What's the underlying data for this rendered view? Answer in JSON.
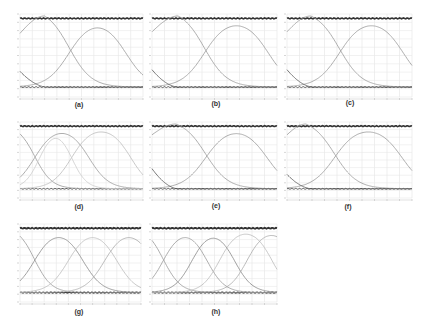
{
  "figure": {
    "panels": [
      {
        "id": "a",
        "label": "(a)",
        "x": 20,
        "y": 14,
        "w": 123,
        "h": 83,
        "label_x": 79,
        "label_y": 101
      },
      {
        "id": "b",
        "label": "(b)",
        "x": 152,
        "y": 14,
        "w": 125,
        "h": 83,
        "label_x": 216,
        "label_y": 100
      },
      {
        "id": "c",
        "label": "(c)",
        "x": 287,
        "y": 14,
        "w": 125,
        "h": 83,
        "label_x": 350,
        "label_y": 99
      },
      {
        "id": "d",
        "label": "(d)",
        "x": 20,
        "y": 122,
        "w": 123,
        "h": 76,
        "label_x": 79,
        "label_y": 203
      },
      {
        "id": "e",
        "label": "(e)",
        "x": 152,
        "y": 122,
        "w": 125,
        "h": 76,
        "label_x": 216,
        "label_y": 202
      },
      {
        "id": "f",
        "label": "(f)",
        "x": 287,
        "y": 122,
        "w": 125,
        "h": 76,
        "label_x": 348,
        "label_y": 203
      },
      {
        "id": "g",
        "label": "(g)",
        "x": 20,
        "y": 224,
        "w": 121,
        "h": 78,
        "label_x": 79,
        "label_y": 308
      },
      {
        "id": "h",
        "label": "(h)",
        "x": 152,
        "y": 224,
        "w": 125,
        "h": 78,
        "label_x": 216,
        "label_y": 308
      }
    ]
  },
  "chart_data": [
    {
      "panel": "(a)",
      "type": "line",
      "title": "",
      "xlabel": "",
      "ylabel": "",
      "grid": true,
      "ylim": [
        0,
        1
      ],
      "xlim": [
        0,
        10
      ],
      "series": [
        {
          "name": "upper band",
          "kind": "flat",
          "level": 0.97,
          "color": "#333333",
          "width": 1.6
        },
        {
          "name": "lower band",
          "kind": "flat",
          "level": 0.1,
          "color": "#555555",
          "width": 1.0
        },
        {
          "name": "curve 1 (falling)",
          "kind": "fall",
          "center": 4.0,
          "width": 0.9,
          "start": 0.78,
          "peak_at": 2.0,
          "color": "#999999"
        },
        {
          "name": "curve 2 (rising)",
          "kind": "bump",
          "rise": 4.0,
          "fall": 8.6,
          "width": 0.9,
          "color": "#999999"
        },
        {
          "name": "decay",
          "kind": "decay",
          "start": 0.3,
          "end": 2.2,
          "color": "#555555"
        }
      ]
    },
    {
      "panel": "(b)",
      "type": "line",
      "title": "",
      "xlabel": "",
      "ylabel": "",
      "grid": true,
      "ylim": [
        0,
        1
      ],
      "xlim": [
        0,
        10
      ],
      "series": [
        {
          "name": "upper band",
          "kind": "flat",
          "level": 0.97,
          "color": "#333333",
          "width": 1.6
        },
        {
          "name": "lower band",
          "kind": "flat",
          "level": 0.1,
          "color": "#555555",
          "width": 1.0
        },
        {
          "name": "curve 1 (falling)",
          "kind": "fall",
          "center": 4.2,
          "width": 0.9,
          "start": 0.8,
          "peak_at": 2.1,
          "color": "#999999"
        },
        {
          "name": "curve 2 (rising)",
          "kind": "bump",
          "rise": 4.2,
          "fall": 9.3,
          "width": 0.9,
          "color": "#999999"
        },
        {
          "name": "decay",
          "kind": "decay",
          "start": 0.32,
          "end": 2.1,
          "color": "#555555"
        }
      ]
    },
    {
      "panel": "(c)",
      "type": "line",
      "title": "",
      "xlabel": "",
      "ylabel": "",
      "grid": true,
      "ylim": [
        0,
        1
      ],
      "xlim": [
        0,
        10
      ],
      "series": [
        {
          "name": "upper band",
          "kind": "flat",
          "level": 0.97,
          "color": "#333333",
          "width": 1.6
        },
        {
          "name": "lower band",
          "kind": "flat",
          "level": 0.1,
          "color": "#555555",
          "width": 1.0
        },
        {
          "name": "curve 1 (falling)",
          "kind": "fall",
          "center": 4.2,
          "width": 0.9,
          "start": 0.8,
          "peak_at": 1.9,
          "color": "#999999"
        },
        {
          "name": "curve 2 (rising)",
          "kind": "bump",
          "rise": 4.2,
          "fall": 9.3,
          "width": 0.9,
          "color": "#999999"
        },
        {
          "name": "decay",
          "kind": "decay",
          "start": 0.32,
          "end": 2.1,
          "color": "#555555"
        }
      ]
    },
    {
      "panel": "(d)",
      "type": "line",
      "title": "",
      "xlabel": "",
      "ylabel": "",
      "grid": true,
      "ylim": [
        0,
        1
      ],
      "xlim": [
        0,
        10
      ],
      "series": [
        {
          "name": "upper band",
          "kind": "flat",
          "level": 0.97,
          "color": "#333333",
          "width": 1.6
        },
        {
          "name": "lower band",
          "kind": "flat",
          "level": 0.1,
          "color": "#555555",
          "width": 1.0
        },
        {
          "name": "curve 1",
          "kind": "fall",
          "center": 1.2,
          "width": 0.7,
          "start": 1.0,
          "peak_at": 0,
          "color": "#999999"
        },
        {
          "name": "curve 2",
          "kind": "bump",
          "rise": 1.2,
          "fall": 5.6,
          "width": 0.8,
          "color": "#999999"
        },
        {
          "name": "curve 3",
          "kind": "bump",
          "rise": 4.2,
          "fall": 9.0,
          "width": 0.8,
          "color": "#bbbbbb"
        },
        {
          "name": "curve 4",
          "kind": "bump",
          "rise": 1.6,
          "fall": 4.2,
          "width": 0.6,
          "color": "#cccccc"
        }
      ]
    },
    {
      "panel": "(e)",
      "type": "line",
      "title": "",
      "xlabel": "",
      "ylabel": "",
      "grid": true,
      "ylim": [
        0,
        1
      ],
      "xlim": [
        0,
        10
      ],
      "series": [
        {
          "name": "upper band",
          "kind": "flat",
          "level": 0.97,
          "color": "#333333",
          "width": 1.6
        },
        {
          "name": "lower band",
          "kind": "flat",
          "level": 0.1,
          "color": "#555555",
          "width": 1.0
        },
        {
          "name": "curve 1 (falling)",
          "kind": "fall",
          "center": 4.3,
          "width": 0.9,
          "start": 0.85,
          "peak_at": 1.9,
          "color": "#999999"
        },
        {
          "name": "curve 2 (rising)",
          "kind": "bump",
          "rise": 4.3,
          "fall": 9.2,
          "width": 0.9,
          "color": "#999999"
        },
        {
          "name": "decay",
          "kind": "decay",
          "start": 0.38,
          "end": 2.1,
          "color": "#555555"
        }
      ]
    },
    {
      "panel": "(f)",
      "type": "line",
      "title": "",
      "xlabel": "",
      "ylabel": "",
      "grid": true,
      "ylim": [
        0,
        1
      ],
      "xlim": [
        0,
        10
      ],
      "series": [
        {
          "name": "upper band",
          "kind": "flat",
          "level": 0.97,
          "color": "#333333",
          "width": 1.6
        },
        {
          "name": "lower band",
          "kind": "flat",
          "level": 0.1,
          "color": "#555555",
          "width": 1.0
        },
        {
          "name": "curve 1 (falling)",
          "kind": "fall",
          "center": 3.8,
          "width": 0.9,
          "start": 0.85,
          "peak_at": 1.5,
          "color": "#999999"
        },
        {
          "name": "curve 2 (rising)",
          "kind": "bump",
          "rise": 3.8,
          "fall": 9.2,
          "width": 0.9,
          "color": "#999999"
        },
        {
          "name": "decay",
          "kind": "decay",
          "start": 0.3,
          "end": 2.0,
          "color": "#555555"
        }
      ]
    },
    {
      "panel": "(g)",
      "type": "line",
      "title": "",
      "xlabel": "",
      "ylabel": "",
      "grid": true,
      "ylim": [
        0,
        1
      ],
      "xlim": [
        0,
        10
      ],
      "series": [
        {
          "name": "upper band",
          "kind": "flat",
          "level": 0.97,
          "color": "#333333",
          "width": 1.8
        },
        {
          "name": "lower band",
          "kind": "flat",
          "level": 0.1,
          "color": "#444444",
          "width": 1.4
        },
        {
          "name": "curve 1",
          "kind": "fall",
          "center": 1.2,
          "width": 0.7,
          "start": 1.0,
          "peak_at": 0,
          "color": "#999999"
        },
        {
          "name": "curve 2",
          "kind": "bump",
          "rise": 1.2,
          "fall": 5.2,
          "width": 0.8,
          "color": "#888888"
        },
        {
          "name": "curve 3",
          "kind": "bump",
          "rise": 4.0,
          "fall": 8.0,
          "width": 0.8,
          "color": "#bbbbbb"
        },
        {
          "name": "curve 4",
          "kind": "bump",
          "rise": 7.0,
          "fall": 11.0,
          "width": 0.8,
          "color": "#aaaaaa"
        }
      ]
    },
    {
      "panel": "(h)",
      "type": "line",
      "title": "",
      "xlabel": "",
      "ylabel": "",
      "grid": true,
      "ylim": [
        0,
        1
      ],
      "xlim": [
        0,
        10
      ],
      "series": [
        {
          "name": "upper band",
          "kind": "flat",
          "level": 0.97,
          "color": "#333333",
          "width": 1.8
        },
        {
          "name": "lower band",
          "kind": "flat",
          "level": 0.1,
          "color": "#444444",
          "width": 1.4
        },
        {
          "name": "curve 1",
          "kind": "fall",
          "center": 0.9,
          "width": 0.7,
          "start": 1.0,
          "peak_at": 0,
          "color": "#999999"
        },
        {
          "name": "curve 2",
          "kind": "bump",
          "rise": 0.9,
          "fall": 4.4,
          "width": 0.7,
          "color": "#999999"
        },
        {
          "name": "curve 3",
          "kind": "bump",
          "rise": 3.2,
          "fall": 6.6,
          "width": 0.7,
          "color": "#888888"
        },
        {
          "name": "curve 4",
          "kind": "bump",
          "rise": 5.4,
          "fall": 9.6,
          "width": 0.7,
          "color": "#bbbbbb"
        },
        {
          "name": "curve 5",
          "kind": "bump",
          "rise": 7.6,
          "fall": 11.5,
          "width": 0.7,
          "color": "#aaaaaa"
        }
      ]
    }
  ]
}
